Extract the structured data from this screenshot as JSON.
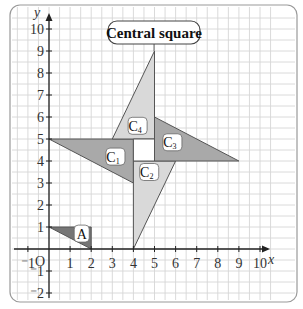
{
  "title_badge": "Central square",
  "axes": {
    "x_label": "x",
    "y_label": "y",
    "origin_label": "O",
    "x_ticks": [
      "-1",
      "1",
      "2",
      "3",
      "4",
      "5",
      "6",
      "7",
      "8",
      "9",
      "10"
    ],
    "y_ticks": [
      "10",
      "9",
      "8",
      "7",
      "6",
      "5",
      "4",
      "3",
      "2",
      "1",
      "-1",
      "-2"
    ],
    "x_range": [
      -1.5,
      10.5
    ],
    "y_range": [
      -2.4,
      10.6
    ]
  },
  "shapes": [
    {
      "name": "A",
      "label": "A",
      "sub": "",
      "vertices": [
        [
          0,
          1
        ],
        [
          2,
          1
        ],
        [
          2,
          0
        ]
      ],
      "fill": "#767676"
    },
    {
      "name": "C1",
      "label": "C",
      "sub": "1",
      "vertices": [
        [
          0,
          5
        ],
        [
          4,
          5
        ],
        [
          4,
          3
        ]
      ],
      "fill": "#a9a9a9"
    },
    {
      "name": "C2",
      "label": "C",
      "sub": "2",
      "vertices": [
        [
          4,
          4
        ],
        [
          6,
          4
        ],
        [
          4,
          0
        ]
      ],
      "fill": "#d9d9d9"
    },
    {
      "name": "C3",
      "label": "C",
      "sub": "3",
      "vertices": [
        [
          5,
          6
        ],
        [
          9,
          4
        ],
        [
          5,
          4
        ]
      ],
      "fill": "#a9a9a9"
    },
    {
      "name": "C4",
      "label": "C",
      "sub": "4",
      "vertices": [
        [
          3,
          5
        ],
        [
          5,
          9
        ],
        [
          5,
          5
        ]
      ],
      "fill": "#d9d9d9"
    }
  ],
  "central_square": {
    "vertices": [
      [
        4,
        4
      ],
      [
        5,
        4
      ],
      [
        5,
        5
      ],
      [
        4,
        5
      ]
    ]
  },
  "colors": {
    "grid": "#d6d6d6",
    "axis": "#222222",
    "frame": "#9a9a9a",
    "dark_fill": "#767676",
    "mid_fill": "#a9a9a9",
    "light_fill": "#d9d9d9"
  }
}
